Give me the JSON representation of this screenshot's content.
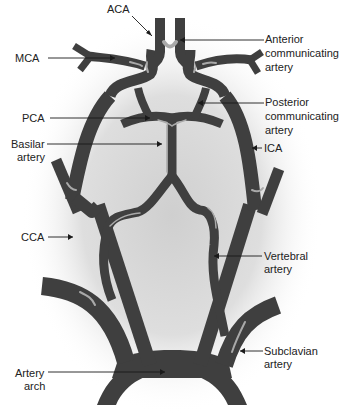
{
  "diagram": {
    "colors": {
      "vessel": "#3f3f3f",
      "vessel_highlight": "#a9a9a9",
      "background_glow": "#d6d6d6",
      "label": "#222222"
    },
    "labels": {
      "aca": "ACA",
      "mca": "MCA",
      "anterior_comm_1": "Anterior",
      "anterior_comm_2": "communicating",
      "anterior_comm_3": "artery",
      "pca": "PCA",
      "posterior_comm_1": "Posterior",
      "posterior_comm_2": "communicating",
      "posterior_comm_3": "artery",
      "basilar_1": "Basilar",
      "basilar_2": "artery",
      "ica": "ICA",
      "cca": "CCA",
      "vertebral_1": "Vertebral",
      "vertebral_2": "artery",
      "subclavian_1": "Subclavian",
      "subclavian_2": "artery",
      "arch_1": "Artery",
      "arch_2": "arch"
    }
  }
}
